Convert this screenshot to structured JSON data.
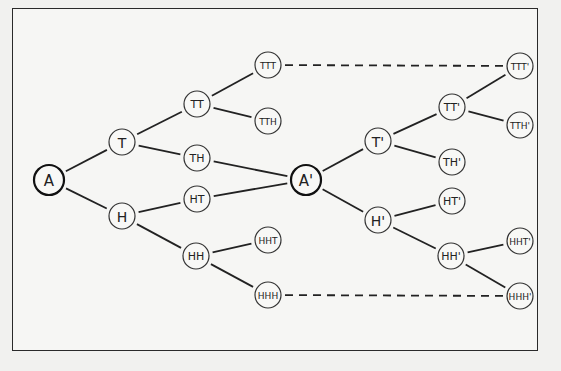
{
  "diagram": {
    "type": "tree",
    "nodes": [
      {
        "id": "A",
        "label": "A",
        "x": 49,
        "y": 180,
        "r": 15,
        "root": true,
        "fs": 15
      },
      {
        "id": "T",
        "label": "T",
        "x": 122,
        "y": 142,
        "r": 13,
        "fs": 14
      },
      {
        "id": "H",
        "label": "H",
        "x": 122,
        "y": 216,
        "r": 13,
        "fs": 14
      },
      {
        "id": "TT",
        "label": "TT",
        "x": 197,
        "y": 104,
        "r": 13,
        "fs": 11
      },
      {
        "id": "TH",
        "label": "TH",
        "x": 197,
        "y": 158,
        "r": 13,
        "fs": 11
      },
      {
        "id": "HT",
        "label": "HT",
        "x": 197,
        "y": 199,
        "r": 13,
        "fs": 11
      },
      {
        "id": "HH",
        "label": "HH",
        "x": 196,
        "y": 256,
        "r": 13,
        "fs": 11
      },
      {
        "id": "TTT",
        "label": "TTT",
        "x": 268,
        "y": 65,
        "r": 13,
        "fs": 9
      },
      {
        "id": "TTH",
        "label": "TTH",
        "x": 268,
        "y": 121,
        "r": 13,
        "fs": 9
      },
      {
        "id": "HHT",
        "label": "HHT",
        "x": 268,
        "y": 240,
        "r": 13,
        "fs": 9
      },
      {
        "id": "HHH",
        "label": "HHH",
        "x": 268,
        "y": 295,
        "r": 13,
        "fs": 9
      },
      {
        "id": "A1",
        "label": "A'",
        "x": 306,
        "y": 180,
        "r": 15,
        "root": true,
        "fs": 15
      },
      {
        "id": "T1",
        "label": "T'",
        "x": 378,
        "y": 141,
        "r": 13,
        "fs": 14
      },
      {
        "id": "H1",
        "label": "H'",
        "x": 378,
        "y": 220,
        "r": 13,
        "fs": 14
      },
      {
        "id": "TT1",
        "label": "TT'",
        "x": 452,
        "y": 107,
        "r": 13,
        "fs": 11
      },
      {
        "id": "TH1",
        "label": "TH'",
        "x": 452,
        "y": 162,
        "r": 13,
        "fs": 11
      },
      {
        "id": "HT1",
        "label": "HT'",
        "x": 452,
        "y": 201,
        "r": 13,
        "fs": 11
      },
      {
        "id": "HH1",
        "label": "HH'",
        "x": 451,
        "y": 256,
        "r": 13,
        "fs": 11
      },
      {
        "id": "TTT1",
        "label": "TTT'",
        "x": 520,
        "y": 66,
        "r": 13,
        "fs": 9
      },
      {
        "id": "TTH1",
        "label": "TTH'",
        "x": 520,
        "y": 125,
        "r": 13,
        "fs": 9
      },
      {
        "id": "HHT1",
        "label": "HHT'",
        "x": 520,
        "y": 241,
        "r": 13,
        "fs": 9
      },
      {
        "id": "HHH1",
        "label": "HHH'",
        "x": 520,
        "y": 296,
        "r": 13,
        "fs": 9
      }
    ],
    "edges": [
      {
        "from": "A",
        "to": "T"
      },
      {
        "from": "A",
        "to": "H"
      },
      {
        "from": "T",
        "to": "TT"
      },
      {
        "from": "T",
        "to": "TH"
      },
      {
        "from": "H",
        "to": "HT"
      },
      {
        "from": "H",
        "to": "HH"
      },
      {
        "from": "TT",
        "to": "TTT"
      },
      {
        "from": "TT",
        "to": "TTH"
      },
      {
        "from": "HH",
        "to": "HHT"
      },
      {
        "from": "HH",
        "to": "HHH"
      },
      {
        "from": "TH",
        "to": "A1"
      },
      {
        "from": "HT",
        "to": "A1"
      },
      {
        "from": "A1",
        "to": "T1"
      },
      {
        "from": "A1",
        "to": "H1"
      },
      {
        "from": "T1",
        "to": "TT1"
      },
      {
        "from": "T1",
        "to": "TH1"
      },
      {
        "from": "H1",
        "to": "HT1"
      },
      {
        "from": "H1",
        "to": "HH1"
      },
      {
        "from": "TT1",
        "to": "TTT1"
      },
      {
        "from": "TT1",
        "to": "TTH1"
      },
      {
        "from": "HH1",
        "to": "HHT1"
      },
      {
        "from": "HH1",
        "to": "HHH1"
      },
      {
        "from": "TTT",
        "to": "TTT1",
        "dashed": true
      },
      {
        "from": "HHH",
        "to": "HHH1",
        "dashed": true
      }
    ]
  }
}
